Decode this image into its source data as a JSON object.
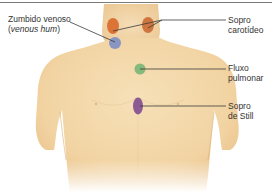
{
  "diagram": {
    "labels": {
      "venous_hum_line1": "Zumbido venoso",
      "venous_hum_line2_open": "(",
      "venous_hum_line2_italic": "venous hum",
      "venous_hum_line2_close": ")",
      "carotid_line1": "Sopro",
      "carotid_line2": "carotídeo",
      "pulmonary_line1": "Fluxo",
      "pulmonary_line2": "pulmonar",
      "still_line1": "Sopro",
      "still_line2": "de Still"
    },
    "markers": [
      {
        "name": "venous-hum",
        "color": "#7d8fc4",
        "shape": "circle"
      },
      {
        "name": "carotid-left",
        "color": "#d9692c",
        "shape": "ellipse"
      },
      {
        "name": "carotid-right",
        "color": "#d9692c",
        "shape": "ellipse"
      },
      {
        "name": "pulmonary-flow",
        "color": "#7fb878",
        "shape": "circle"
      },
      {
        "name": "still-murmur",
        "color": "#8e5a93",
        "shape": "ellipse"
      }
    ],
    "colors": {
      "skin": "#f4d9ad",
      "skin_shadow": "#e8c38e",
      "leader_line": "#3a3a3a",
      "rule": "#7a7a7a"
    }
  }
}
